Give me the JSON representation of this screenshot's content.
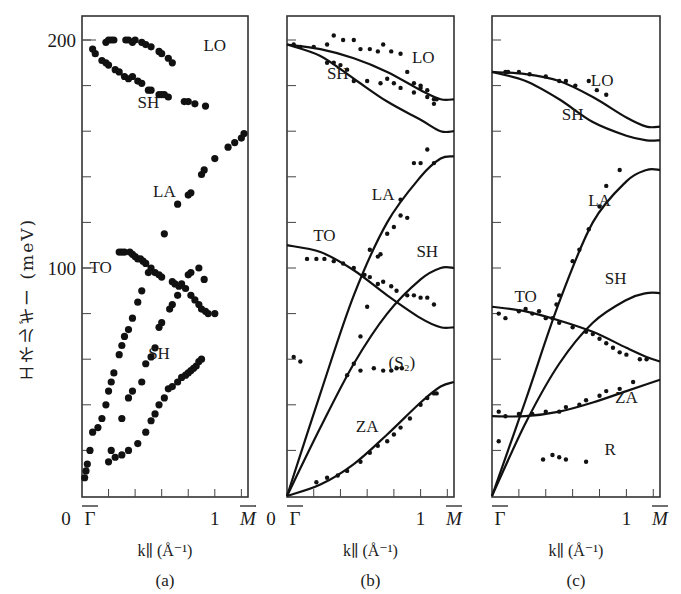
{
  "figure": {
    "ylabel": "エネルギー (meV)",
    "y_ticks": [
      "200",
      "100",
      "0"
    ],
    "xlabel": "k∥ (Å⁻¹)",
    "x_tick_start": "Γ̄",
    "x_tick_mid": "1",
    "x_tick_end": "M̄",
    "panels": [
      "(a)",
      "(b)",
      "(c)"
    ]
  },
  "chart_data": [
    {
      "type": "scatter",
      "panel": "(a)",
      "title": "(a)",
      "xlabel": "k∥ (Å⁻¹)",
      "ylabel": "エネルギー (meV)",
      "xlim": [
        0,
        1.25
      ],
      "ylim": [
        0,
        210
      ],
      "x_tick_labels": [
        "Γ̄",
        "1",
        "M̄"
      ],
      "y_tick_labels": [
        "0",
        "100",
        "200"
      ],
      "annotations": [
        "LO",
        "SH",
        "LA",
        "TO",
        "SH"
      ],
      "series": [
        {
          "name": "LO",
          "x": [
            0.18,
            0.2,
            0.22,
            0.24,
            0.33,
            0.35,
            0.38,
            0.4,
            0.45,
            0.48,
            0.52,
            0.58,
            0.6,
            0.65,
            0.68
          ],
          "y": [
            199,
            200,
            200,
            200,
            200,
            200,
            199,
            200,
            199,
            198,
            197,
            195,
            194,
            192,
            190
          ]
        },
        {
          "name": "SH (upper)",
          "x": [
            0.08,
            0.1,
            0.15,
            0.18,
            0.2,
            0.25,
            0.28,
            0.32,
            0.35,
            0.38,
            0.42,
            0.45,
            0.5,
            0.52,
            0.58,
            0.6,
            0.62,
            0.65,
            0.77,
            0.8,
            0.85,
            0.93
          ],
          "y": [
            196,
            194,
            191,
            190,
            189,
            187,
            186,
            184,
            183,
            184,
            182,
            181,
            178,
            178,
            176,
            176,
            176,
            175,
            173,
            173,
            172,
            171
          ]
        },
        {
          "name": "LA",
          "x": [
            0.62,
            0.72,
            0.8,
            0.82,
            0.9,
            0.92,
            1.0,
            1.1,
            1.15,
            1.2,
            1.22
          ],
          "y": [
            115,
            128,
            132,
            133,
            141,
            143,
            148,
            153,
            155,
            157,
            159
          ]
        },
        {
          "name": "TO",
          "x": [
            0.28,
            0.3,
            0.32,
            0.36,
            0.38,
            0.4,
            0.42,
            0.44,
            0.46,
            0.48,
            0.52,
            0.55,
            0.58,
            0.6,
            0.68,
            0.7,
            0.73,
            0.78,
            0.82,
            0.85,
            0.88,
            0.9,
            0.93,
            0.95,
            1.0
          ],
          "y": [
            107,
            107,
            107,
            107,
            106,
            105,
            104,
            104,
            103,
            102,
            100,
            98,
            97,
            96,
            94,
            93,
            92,
            91,
            88,
            86,
            84,
            82,
            81,
            80,
            80
          ]
        },
        {
          "name": "SH (lower branch, steep)",
          "x": [
            0.02,
            0.03,
            0.04,
            0.06,
            0.08,
            0.12,
            0.15,
            0.18,
            0.2,
            0.22,
            0.24,
            0.28,
            0.3,
            0.32,
            0.35,
            0.38,
            0.42,
            0.45,
            0.5
          ],
          "y": [
            8,
            11,
            14,
            20,
            28,
            30,
            34,
            40,
            46,
            50,
            54,
            62,
            66,
            70,
            73,
            78,
            85,
            90,
            98
          ]
        },
        {
          "name": "SH (middle branch)",
          "x": [
            0.22,
            0.3,
            0.35,
            0.38,
            0.45,
            0.48,
            0.52,
            0.55,
            0.58,
            0.6,
            0.66,
            0.68,
            0.72,
            0.75,
            0.8,
            0.82,
            0.88,
            0.92
          ],
          "y": [
            20,
            34,
            43,
            46,
            50,
            58,
            61,
            65,
            74,
            76,
            82,
            84,
            88,
            93,
            97,
            98,
            100,
            95
          ]
        },
        {
          "name": "SH (lowest branch)",
          "x": [
            0.2,
            0.25,
            0.3,
            0.35,
            0.42,
            0.48,
            0.52,
            0.55,
            0.58,
            0.62,
            0.65,
            0.68,
            0.72,
            0.75,
            0.78,
            0.8,
            0.82,
            0.84,
            0.86,
            0.88,
            0.9
          ],
          "y": [
            15,
            17,
            18,
            20,
            23,
            28,
            33,
            36,
            40,
            43,
            47,
            48,
            50,
            52,
            53,
            54,
            55,
            56,
            57,
            59,
            60
          ]
        }
      ]
    },
    {
      "type": "scatter",
      "panel": "(b)",
      "title": "(b)",
      "xlabel": "k∥ (Å⁻¹)",
      "ylabel": "",
      "xlim": [
        0,
        1.25
      ],
      "ylim": [
        0,
        210
      ],
      "x_tick_labels": [
        "Γ̄",
        "1",
        "M̄"
      ],
      "annotations": [
        "LO",
        "SH",
        "LA",
        "TO",
        "SH",
        "(S₂)",
        "ZA"
      ],
      "series": [
        {
          "name": "LO (calc)",
          "style": "line",
          "x": [
            0,
            0.25,
            0.5,
            0.75,
            1.0,
            1.15,
            1.25
          ],
          "y": [
            198,
            196,
            192,
            186,
            178,
            174,
            174
          ]
        },
        {
          "name": "SH upper (calc)",
          "style": "line",
          "x": [
            0,
            0.25,
            0.5,
            0.75,
            1.0,
            1.15,
            1.25
          ],
          "y": [
            198,
            193,
            183,
            173,
            165,
            160,
            160
          ]
        },
        {
          "name": "LA (calc)",
          "style": "line",
          "x": [
            0,
            0.25,
            0.5,
            0.75,
            1.0,
            1.15,
            1.25
          ],
          "y": [
            0,
            45,
            88,
            120,
            140,
            148,
            149
          ]
        },
        {
          "name": "TO (calc)",
          "style": "line",
          "x": [
            0,
            0.25,
            0.5,
            0.75,
            1.0,
            1.15,
            1.25
          ],
          "y": [
            110,
            107,
            99,
            88,
            78,
            74,
            74
          ]
        },
        {
          "name": "SH lower (calc)",
          "style": "line",
          "x": [
            0,
            0.25,
            0.5,
            0.75,
            1.0,
            1.15,
            1.25
          ],
          "y": [
            0,
            30,
            58,
            80,
            95,
            100,
            100
          ]
        },
        {
          "name": "ZA (calc)",
          "style": "line",
          "x": [
            0,
            0.25,
            0.5,
            0.75,
            1.0,
            1.15,
            1.25
          ],
          "y": [
            0,
            5,
            14,
            27,
            41,
            48,
            50
          ]
        },
        {
          "name": "LO/SH (expt)",
          "style": "points",
          "x": [
            0.05,
            0.1,
            0.2,
            0.3,
            0.35,
            0.42,
            0.5,
            0.55,
            0.62,
            0.68,
            0.72,
            0.78,
            0.85,
            0.9,
            0.95,
            1.0,
            1.05,
            1.1,
            0.3,
            0.35,
            0.4,
            0.45,
            0.5,
            0.6,
            0.7,
            0.75,
            0.8,
            0.85,
            0.95,
            1.0,
            1.05,
            1.1,
            1.12
          ],
          "y": [
            198,
            197,
            197,
            198,
            202,
            200,
            200,
            196,
            196,
            195,
            198,
            195,
            194,
            186,
            181,
            180,
            178,
            174,
            190,
            190,
            189,
            187,
            182,
            182,
            181,
            183,
            181,
            179,
            177,
            179,
            175,
            172,
            174
          ]
        },
        {
          "name": "LA (expt)",
          "style": "points",
          "x": [
            0.6,
            0.68,
            0.75,
            0.8,
            0.85,
            0.95,
            1.0,
            1.05,
            1.1,
            0.85,
            0.9,
            0.62,
            0.7,
            0.55,
            0.5
          ],
          "y": [
            83,
            105,
            115,
            118,
            130,
            146,
            146,
            152,
            146,
            123,
            122,
            108,
            106,
            70,
            58
          ]
        },
        {
          "name": "TO (expt)",
          "style": "points",
          "x": [
            0.15,
            0.22,
            0.28,
            0.35,
            0.42,
            0.5,
            0.58,
            0.62,
            0.68,
            0.72,
            0.78,
            0.82,
            0.9,
            0.95,
            1.0,
            1.05,
            1.1
          ],
          "y": [
            104,
            104,
            104,
            103,
            102,
            100,
            97,
            96,
            93,
            94,
            92,
            90,
            88,
            88,
            87,
            87,
            84
          ]
        },
        {
          "name": "(S₂) (expt)",
          "style": "points",
          "x": [
            0.05,
            0.1,
            0.45,
            0.55,
            0.65,
            0.72,
            0.78,
            0.82,
            0.86
          ],
          "y": [
            61,
            59,
            53,
            55,
            56,
            55,
            55,
            56,
            56
          ]
        },
        {
          "name": "ZA (expt)",
          "style": "points",
          "x": [
            0.22,
            0.3,
            0.38,
            0.45,
            0.55,
            0.62,
            0.68,
            0.75,
            0.8,
            0.85,
            0.92,
            1.0,
            1.05,
            1.1,
            1.12
          ],
          "y": [
            6,
            8,
            9,
            11,
            15,
            19,
            22,
            24,
            27,
            30,
            34,
            40,
            43,
            45,
            45
          ]
        }
      ]
    },
    {
      "type": "scatter",
      "panel": "(c)",
      "title": "(c)",
      "xlabel": "k∥ (Å⁻¹)",
      "ylabel": "",
      "xlim": [
        0,
        1.25
      ],
      "ylim": [
        0,
        210
      ],
      "x_tick_labels": [
        "Γ̄",
        "1",
        "M̄"
      ],
      "annotations": [
        "LO",
        "SH",
        "LA",
        "TO",
        "SH",
        "ZA",
        "R"
      ],
      "series": [
        {
          "name": "LO (calc)",
          "style": "line",
          "x": [
            0,
            0.25,
            0.5,
            0.75,
            1.0,
            1.15,
            1.25
          ],
          "y": [
            186,
            185,
            182,
            175,
            166,
            162,
            162
          ]
        },
        {
          "name": "SH upper (calc)",
          "style": "line",
          "x": [
            0,
            0.25,
            0.5,
            0.75,
            1.0,
            1.15,
            1.25
          ],
          "y": [
            186,
            182,
            174,
            164,
            158,
            156,
            156
          ]
        },
        {
          "name": "LA (calc)",
          "style": "line",
          "x": [
            0,
            0.25,
            0.5,
            0.75,
            1.0,
            1.15,
            1.25
          ],
          "y": [
            0,
            42,
            85,
            120,
            138,
            143,
            143
          ]
        },
        {
          "name": "TO (calc)",
          "style": "line",
          "x": [
            0,
            0.25,
            0.5,
            0.75,
            1.0,
            1.15,
            1.25
          ],
          "y": [
            83,
            81,
            77,
            72,
            65,
            61,
            59
          ]
        },
        {
          "name": "SH lower (calc)",
          "style": "line",
          "x": [
            0,
            0.25,
            0.5,
            0.75,
            1.0,
            1.15,
            1.25
          ],
          "y": [
            0,
            32,
            58,
            76,
            86,
            89,
            89
          ]
        },
        {
          "name": "ZA (calc)",
          "style": "line",
          "x": [
            0,
            0.25,
            0.5,
            0.75,
            1.0,
            1.15,
            1.25
          ],
          "y": [
            35,
            35,
            37,
            41,
            46,
            49,
            51
          ]
        },
        {
          "name": "LO (expt)",
          "style": "points",
          "x": [
            0.1,
            0.12,
            0.2,
            0.28,
            0.4,
            0.5,
            0.55,
            0.62,
            0.72,
            0.78,
            0.85
          ],
          "y": [
            186,
            186,
            186,
            185,
            184,
            182,
            182,
            180,
            182,
            178,
            176
          ]
        },
        {
          "name": "LA (expt)",
          "style": "points",
          "x": [
            0.48,
            0.5,
            0.6,
            0.65,
            0.72,
            0.8,
            0.85,
            0.95
          ],
          "y": [
            84,
            88,
            103,
            108,
            117,
            127,
            136,
            143
          ]
        },
        {
          "name": "TO (expt)",
          "style": "points",
          "x": [
            0.05,
            0.1,
            0.2,
            0.25,
            0.3,
            0.35,
            0.4,
            0.45,
            0.5,
            0.6,
            0.7,
            0.75,
            0.8,
            0.85,
            0.9,
            0.95,
            1.0,
            1.1,
            1.15
          ],
          "y": [
            80,
            78,
            81,
            82,
            80,
            81,
            78,
            78,
            76,
            74,
            72,
            71,
            69,
            67,
            65,
            63,
            62,
            60,
            60
          ]
        },
        {
          "name": "ZA (expt)",
          "style": "points",
          "x": [
            0.05,
            0.1,
            0.2,
            0.3,
            0.4,
            0.5,
            0.55,
            0.65,
            0.7,
            0.8,
            0.85,
            0.95,
            1.05
          ],
          "y": [
            37,
            35,
            36,
            36,
            37,
            37,
            39,
            40,
            42,
            44,
            46,
            47,
            50
          ]
        },
        {
          "name": "R (expt)",
          "style": "points",
          "x": [
            0.05,
            0.38,
            0.45,
            0.5,
            0.55,
            0.7
          ],
          "y": [
            24,
            16,
            18,
            17,
            16,
            15
          ]
        }
      ]
    }
  ]
}
